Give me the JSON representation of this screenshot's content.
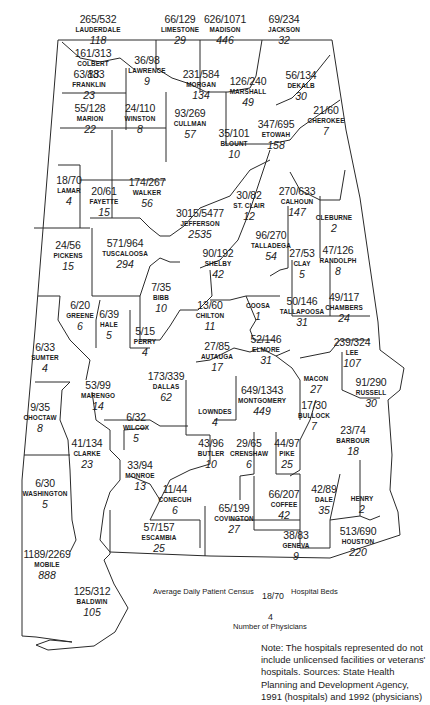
{
  "chart_data": {
    "type": "map",
    "legend": {
      "census_label": "Average Daily Patient Census",
      "beds_label": "Hospital Beds",
      "physicians_label": "Number of Physicians",
      "sample_ratio": "18/70",
      "sample_physicians": "4"
    },
    "note": "Note: The hospitals represented do not include unlicensed facilities or veterans' hospitals. Sources: State Health Planning and Development Agency, 1991 (hospitals) and 1992 (physicians)",
    "counties": [
      {
        "name": "LAUDERDALE",
        "census": 265,
        "beds": 532,
        "physicians": 118,
        "ratio": "265/532",
        "phys": "118",
        "x": 98,
        "y": 14
      },
      {
        "name": "LIMESTONE",
        "census": 66,
        "beds": 129,
        "physicians": 29,
        "ratio": "66/129",
        "phys": "29",
        "x": 180,
        "y": 14
      },
      {
        "name": "MADISON",
        "census": 626,
        "beds": 1071,
        "physicians": 446,
        "ratio": "626/1071",
        "phys": "446",
        "x": 225,
        "y": 14
      },
      {
        "name": "JACKSON",
        "census": 69,
        "beds": 234,
        "physicians": 32,
        "ratio": "69/234",
        "phys": "32",
        "x": 284,
        "y": 14
      },
      {
        "name": "COLBERT",
        "census": 161,
        "beds": 313,
        "physicians": 88,
        "ratio": "161/313",
        "phys": "88",
        "x": 93,
        "y": 48
      },
      {
        "name": "LAWRENCE",
        "census": 36,
        "beds": 98,
        "physicians": 9,
        "ratio": "36/98",
        "phys": "9",
        "x": 147,
        "y": 55
      },
      {
        "name": "FRANKLIN",
        "census": 63,
        "beds": 133,
        "physicians": 23,
        "ratio": "63/133",
        "phys": "23",
        "x": 89,
        "y": 69
      },
      {
        "name": "MORGAN",
        "census": 231,
        "beds": 584,
        "physicians": 134,
        "ratio": "231/584",
        "phys": "134",
        "x": 201,
        "y": 69
      },
      {
        "name": "MARSHALL",
        "census": 126,
        "beds": 240,
        "physicians": 49,
        "ratio": "126/240",
        "phys": "49",
        "x": 248,
        "y": 76
      },
      {
        "name": "DEKALB",
        "census": 56,
        "beds": 134,
        "physicians": 30,
        "ratio": "56/134",
        "phys": "30",
        "x": 301,
        "y": 70
      },
      {
        "name": "MARION",
        "census": 55,
        "beds": 128,
        "physicians": 22,
        "ratio": "55/128",
        "phys": "22",
        "x": 90,
        "y": 103
      },
      {
        "name": "WINSTON",
        "census": 24,
        "beds": 110,
        "physicians": 8,
        "ratio": "24/110",
        "phys": "8",
        "x": 140,
        "y": 103
      },
      {
        "name": "CULLMAN",
        "census": 93,
        "beds": 269,
        "physicians": 57,
        "ratio": "93/269",
        "phys": "57",
        "x": 190,
        "y": 108
      },
      {
        "name": "CHEROKEE",
        "census": 21,
        "beds": 60,
        "physicians": 7,
        "ratio": "21/60",
        "phys": "7",
        "x": 326,
        "y": 105
      },
      {
        "name": "BLOUNT",
        "census": 35,
        "beds": 101,
        "physicians": 10,
        "ratio": "35/101",
        "phys": "10",
        "x": 234,
        "y": 128
      },
      {
        "name": "ETOWAH",
        "census": 347,
        "beds": 695,
        "physicians": 158,
        "ratio": "347/695",
        "phys": "158",
        "x": 276,
        "y": 119
      },
      {
        "name": "LAMAR",
        "census": 18,
        "beds": 70,
        "physicians": 4,
        "ratio": "18/70",
        "phys": "4",
        "x": 69,
        "y": 175
      },
      {
        "name": "FAYETTE",
        "census": 20,
        "beds": 61,
        "physicians": 15,
        "ratio": "20/61",
        "phys": "15",
        "x": 104,
        "y": 186
      },
      {
        "name": "WALKER",
        "census": 174,
        "beds": 267,
        "physicians": 56,
        "ratio": "174/267",
        "phys": "56",
        "x": 147,
        "y": 177
      },
      {
        "name": "ST. CLAIR",
        "census": 30,
        "beds": 82,
        "physicians": 12,
        "ratio": "30/82",
        "phys": "12",
        "x": 249,
        "y": 190
      },
      {
        "name": "CALHOUN",
        "census": 270,
        "beds": 633,
        "physicians": 147,
        "ratio": "270/633",
        "phys": "147",
        "x": 297,
        "y": 186
      },
      {
        "name": "CLEBURNE",
        "census": null,
        "beds": null,
        "physicians": 2,
        "ratio": "",
        "phys": "2",
        "x": 334,
        "y": 213
      },
      {
        "name": "JEFFERSON",
        "census": 3015,
        "beds": 5477,
        "physicians": 2535,
        "ratio": "3015/5477",
        "phys": "2535",
        "x": 200,
        "y": 208
      },
      {
        "name": "TALLADEGA",
        "census": 96,
        "beds": 270,
        "physicians": 54,
        "ratio": "96/270",
        "phys": "54",
        "x": 271,
        "y": 230
      },
      {
        "name": "PICKENS",
        "census": 24,
        "beds": 56,
        "physicians": 15,
        "ratio": "24/56",
        "phys": "15",
        "x": 68,
        "y": 240
      },
      {
        "name": "TUSCALOOSA",
        "census": 571,
        "beds": 964,
        "physicians": 294,
        "ratio": "571/964",
        "phys": "294",
        "x": 125,
        "y": 238
      },
      {
        "name": "SHELBY",
        "census": 90,
        "beds": 192,
        "physicians": 42,
        "ratio": "90/192",
        "phys": "42",
        "x": 218,
        "y": 248
      },
      {
        "name": "CLAY",
        "census": 27,
        "beds": 53,
        "physicians": 5,
        "ratio": "27/53",
        "phys": "5",
        "x": 302,
        "y": 248
      },
      {
        "name": "RANDOLPH",
        "census": 47,
        "beds": 126,
        "physicians": 8,
        "ratio": "47/126",
        "phys": "8",
        "x": 338,
        "y": 245
      },
      {
        "name": "BIBB",
        "census": 7,
        "beds": 35,
        "physicians": 10,
        "ratio": "7/35",
        "phys": "10",
        "x": 161,
        "y": 282
      },
      {
        "name": "GREENE",
        "census": 6,
        "beds": 20,
        "physicians": 6,
        "ratio": "6/20",
        "phys": "6",
        "x": 80,
        "y": 300
      },
      {
        "name": "HALE",
        "census": 6,
        "beds": 39,
        "physicians": 5,
        "ratio": "6/39",
        "phys": "5",
        "x": 109,
        "y": 309
      },
      {
        "name": "CHILTON",
        "census": 13,
        "beds": 60,
        "physicians": 11,
        "ratio": "13/60",
        "phys": "11",
        "x": 210,
        "y": 300
      },
      {
        "name": "COOSA",
        "census": null,
        "beds": null,
        "physicians": 1,
        "ratio": "",
        "phys": "1",
        "x": 258,
        "y": 301
      },
      {
        "name": "TALLAPOOSA",
        "census": 50,
        "beds": 146,
        "physicians": 31,
        "ratio": "50/146",
        "phys": "31",
        "x": 302,
        "y": 296
      },
      {
        "name": "CHAMBERS",
        "census": 49,
        "beds": 117,
        "physicians": 24,
        "ratio": "49/117",
        "phys": "24",
        "x": 344,
        "y": 292
      },
      {
        "name": "PERRY",
        "census": 5,
        "beds": 15,
        "physicians": 4,
        "ratio": "5/15",
        "phys": "4",
        "x": 145,
        "y": 326
      },
      {
        "name": "AUTAUGA",
        "census": 27,
        "beds": 85,
        "physicians": 17,
        "ratio": "27/85",
        "phys": "17",
        "x": 217,
        "y": 341
      },
      {
        "name": "ELMORE",
        "census": 52,
        "beds": 146,
        "physicians": 31,
        "ratio": "52/146",
        "phys": "31",
        "x": 266,
        "y": 334
      },
      {
        "name": "LEE",
        "census": 239,
        "beds": 324,
        "physicians": 107,
        "ratio": "239/324",
        "phys": "107",
        "x": 352,
        "y": 337
      },
      {
        "name": "SUMTER",
        "census": 6,
        "beds": 33,
        "physicians": 4,
        "ratio": "6/33",
        "phys": "4",
        "x": 45,
        "y": 342
      },
      {
        "name": "MARENGO",
        "census": 53,
        "beds": 99,
        "physicians": 14,
        "ratio": "53/99",
        "phys": "14",
        "x": 98,
        "y": 380
      },
      {
        "name": "DALLAS",
        "census": 173,
        "beds": 339,
        "physicians": 62,
        "ratio": "173/339",
        "phys": "62",
        "x": 166,
        "y": 371
      },
      {
        "name": "MONTGOMERY",
        "census": 649,
        "beds": 1343,
        "physicians": 449,
        "ratio": "649/1343",
        "phys": "449",
        "x": 262,
        "y": 385
      },
      {
        "name": "MACON",
        "census": null,
        "beds": null,
        "physicians": 27,
        "ratio": "",
        "phys": "27",
        "x": 316,
        "y": 374
      },
      {
        "name": "RUSSELL",
        "census": 91,
        "beds": 290,
        "physicians": 30,
        "ratio": "91/290",
        "phys": "30",
        "x": 371,
        "y": 377
      },
      {
        "name": "LOWNDES",
        "census": null,
        "beds": null,
        "physicians": 4,
        "ratio": "",
        "phys": "4",
        "x": 215,
        "y": 407
      },
      {
        "name": "BULLOCK",
        "census": 17,
        "beds": 30,
        "physicians": 7,
        "ratio": "17/30",
        "phys": "7",
        "x": 314,
        "y": 400
      },
      {
        "name": "CHOCTAW",
        "census": 9,
        "beds": 35,
        "physicians": 8,
        "ratio": "9/35",
        "phys": "8",
        "x": 40,
        "y": 402
      },
      {
        "name": "WILCOX",
        "census": 6,
        "beds": 32,
        "physicians": 5,
        "ratio": "6/32",
        "phys": "5",
        "x": 136,
        "y": 412
      },
      {
        "name": "BARBOUR",
        "census": 23,
        "beds": 74,
        "physicians": 18,
        "ratio": "23/74",
        "phys": "18",
        "x": 353,
        "y": 425
      },
      {
        "name": "CLARKE",
        "census": 41,
        "beds": 134,
        "physicians": 23,
        "ratio": "41/134",
        "phys": "23",
        "x": 87,
        "y": 438
      },
      {
        "name": "BUTLER",
        "census": 43,
        "beds": 96,
        "physicians": 10,
        "ratio": "43/96",
        "phys": "10",
        "x": 211,
        "y": 438
      },
      {
        "name": "CRENSHAW",
        "census": 29,
        "beds": 65,
        "physicians": 6,
        "ratio": "29/65",
        "phys": "6",
        "x": 249,
        "y": 438
      },
      {
        "name": "PIKE",
        "census": 44,
        "beds": 97,
        "physicians": 25,
        "ratio": "44/97",
        "phys": "25",
        "x": 287,
        "y": 438
      },
      {
        "name": "MONROE",
        "census": 33,
        "beds": 94,
        "physicians": 13,
        "ratio": "33/94",
        "phys": "13",
        "x": 140,
        "y": 460
      },
      {
        "name": "WASHINGTON",
        "census": 6,
        "beds": 30,
        "physicians": 5,
        "ratio": "6/30",
        "phys": "5",
        "x": 45,
        "y": 478
      },
      {
        "name": "CONECUH",
        "census": 11,
        "beds": 44,
        "physicians": 6,
        "ratio": "11/44",
        "phys": "6",
        "x": 175,
        "y": 484
      },
      {
        "name": "COFFEE",
        "census": 66,
        "beds": 207,
        "physicians": 42,
        "ratio": "66/207",
        "phys": "42",
        "x": 284,
        "y": 489
      },
      {
        "name": "DALE",
        "census": 42,
        "beds": 89,
        "physicians": 35,
        "ratio": "42/89",
        "phys": "35",
        "x": 324,
        "y": 484
      },
      {
        "name": "HENRY",
        "census": null,
        "beds": null,
        "physicians": 2,
        "ratio": "",
        "phys": "2",
        "x": 362,
        "y": 494
      },
      {
        "name": "COVINGTON",
        "census": 65,
        "beds": 199,
        "physicians": 27,
        "ratio": "65/199",
        "phys": "27",
        "x": 234,
        "y": 503
      },
      {
        "name": "ESCAMBIA",
        "census": 57,
        "beds": 157,
        "physicians": 25,
        "ratio": "57/157",
        "phys": "25",
        "x": 159,
        "y": 522
      },
      {
        "name": "GENEVA",
        "census": 38,
        "beds": 83,
        "physicians": 9,
        "ratio": "38/83",
        "phys": "9",
        "x": 296,
        "y": 530
      },
      {
        "name": "HOUSTON",
        "census": 513,
        "beds": 690,
        "physicians": 220,
        "ratio": "513/690",
        "phys": "220",
        "x": 358,
        "y": 526
      },
      {
        "name": "MOBILE",
        "census": 1189,
        "beds": 2269,
        "physicians": 888,
        "ratio": "1189/2269",
        "phys": "888",
        "x": 47,
        "y": 549
      },
      {
        "name": "BALDWIN",
        "census": 125,
        "beds": 312,
        "physicians": 105,
        "ratio": "125/312",
        "phys": "105",
        "x": 92,
        "y": 586
      }
    ]
  }
}
